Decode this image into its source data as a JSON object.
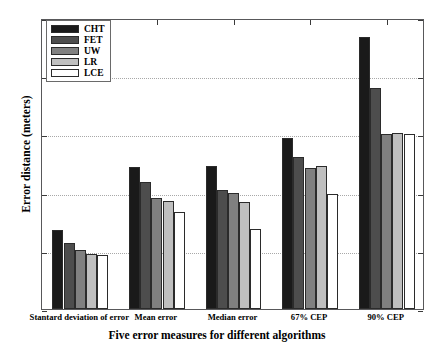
{
  "chart_data": {
    "type": "bar",
    "title": "",
    "xlabel": "Five error measures for different algorithms",
    "ylabel": "Error distance (meters)",
    "categories": [
      "Stantard deviation of error",
      "Mean error",
      "Median error",
      "67% CEP",
      "90% CEP"
    ],
    "series": [
      {
        "name": "CHT",
        "color": "#1a1a1a",
        "values": [
          68,
          122,
          123,
          147,
          234
        ]
      },
      {
        "name": "FET",
        "color": "#4d4d4d",
        "values": [
          57,
          109,
          102,
          131,
          190
        ]
      },
      {
        "name": "UW",
        "color": "#808080",
        "values": [
          51,
          95,
          100,
          121,
          150
        ]
      },
      {
        "name": "LR",
        "color": "#bfbfbf",
        "values": [
          47,
          93,
          92,
          123,
          151
        ]
      },
      {
        "name": "LCE",
        "color": "#ffffff",
        "values": [
          46,
          83,
          69,
          99,
          150
        ]
      }
    ],
    "ylim": [
      0,
      250
    ],
    "yticks": [
      0,
      50,
      100,
      150,
      200,
      250
    ],
    "ytick_labels": [
      "0",
      "50",
      "100",
      "150",
      "200",
      "250"
    ],
    "grid": true,
    "legend_position": "upper left",
    "bar_edge_color": "#2b2b2b",
    "axis_color": "#58585a",
    "gridline_color": "#a8a8a8"
  }
}
